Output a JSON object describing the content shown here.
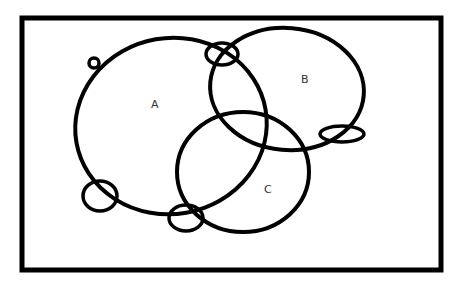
{
  "diagram": {
    "type": "venn",
    "frame": {
      "x": 22,
      "y": 18,
      "width": 419,
      "height": 252,
      "stroke": "#000000",
      "stroke_width": 5
    },
    "sets": [
      {
        "id": "A",
        "label": "A",
        "cx": 171,
        "cy": 126,
        "rx": 96,
        "ry": 88,
        "rotate": -10,
        "label_x": 151,
        "label_y": 108
      },
      {
        "id": "B",
        "label": "B",
        "cx": 287,
        "cy": 89,
        "rx": 77,
        "ry": 61,
        "rotate": 5,
        "label_x": 301,
        "label_y": 83
      },
      {
        "id": "C",
        "label": "C",
        "cx": 243,
        "cy": 172,
        "rx": 66,
        "ry": 60,
        "rotate": 0,
        "label_x": 264,
        "label_y": 193
      }
    ],
    "loops": [
      {
        "id": "loop-top-left",
        "cx": 94,
        "cy": 63,
        "rx": 5,
        "ry": 5
      },
      {
        "id": "loop-top-ab",
        "cx": 222,
        "cy": 54,
        "rx": 16,
        "ry": 11
      },
      {
        "id": "loop-right-b",
        "cx": 342,
        "cy": 134,
        "rx": 22,
        "ry": 8
      },
      {
        "id": "loop-bottom-left",
        "cx": 100,
        "cy": 196,
        "rx": 17,
        "ry": 15
      },
      {
        "id": "loop-bottom-mid",
        "cx": 186,
        "cy": 218,
        "rx": 17,
        "ry": 13
      }
    ],
    "stroke_color": "#000000",
    "stroke_width": 4
  }
}
